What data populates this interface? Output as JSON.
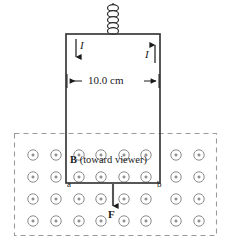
{
  "figure": {
    "type": "physics-diagram",
    "background_color": "#ffffff",
    "line_color": "#1a1a1a",
    "field_symbol_color": "#8c8c8c",
    "dashed_border_color": "#9a9a9a"
  },
  "spring": {
    "name": "suspension-spring",
    "coil_count": 5,
    "center_x": 113,
    "top_y": 4,
    "bottom_y": 34,
    "coil_radius_x": 5.5,
    "coil_radius_y": 3.2
  },
  "loop": {
    "name": "rectangular-current-loop",
    "left_x": 66,
    "right_x": 160,
    "top_y": 34,
    "bottom_y": 183,
    "stroke_width": 1.6
  },
  "currents": [
    {
      "id": "current-left",
      "label": "I",
      "direction": "down",
      "arrow_x": 76,
      "arrow_top_y": 39,
      "arrow_bottom_y": 63,
      "label_x": 80,
      "label_y": 43
    },
    {
      "id": "current-right",
      "label": "I",
      "direction": "up",
      "arrow_x": 155,
      "arrow_top_y": 39,
      "arrow_bottom_y": 63,
      "label_x": 145,
      "label_y": 51
    }
  ],
  "dimension": {
    "name": "loop-width-dimension",
    "label": "10.0 cm",
    "y": 81,
    "left_x": 67,
    "right_x": 159,
    "label_x": 88,
    "label_y": 75
  },
  "field_region": {
    "name": "magnetic-field-region",
    "left_x": 14,
    "right_x": 217,
    "top_y": 133,
    "bottom_y": 236,
    "dash_pattern": "5 4",
    "label": {
      "symbol": "B",
      "text": " (toward viewer)",
      "x": 70,
      "y": 155
    },
    "dot_columns_x": [
      33,
      56,
      79,
      101,
      124,
      146,
      176,
      199
    ],
    "dot_rows_y": [
      155,
      177,
      199,
      221
    ],
    "dot_outer_radius": 5.2,
    "dot_inner_radius": 1.1
  },
  "corner_labels": [
    {
      "id": "corner-a",
      "label": "a",
      "x": 67,
      "y": 180
    },
    {
      "id": "corner-b",
      "label": "b",
      "x": 157,
      "y": 180
    }
  ],
  "force": {
    "name": "force-vector",
    "label": "F",
    "direction": "down",
    "arrow_x": 113,
    "arrow_top_y": 184,
    "arrow_bottom_y": 212,
    "label_x": 108,
    "label_y": 214
  }
}
